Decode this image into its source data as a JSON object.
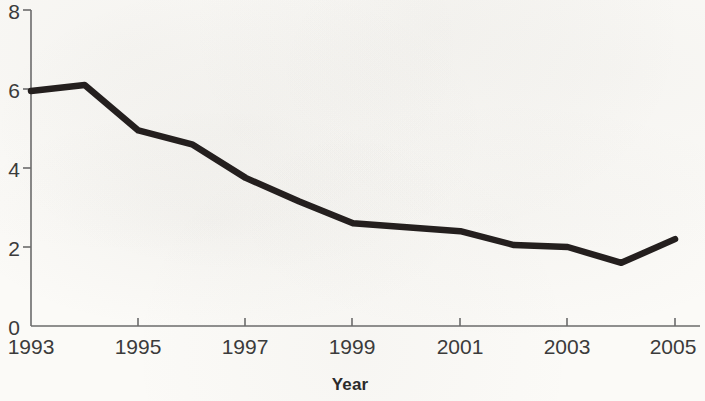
{
  "figure": {
    "background_color": "#fbfaf7",
    "line_color": "#241f1e",
    "axis_color": "#6b6b6b",
    "text_color": "#3b3b3b"
  },
  "chart_data": {
    "type": "line",
    "title": "",
    "subtitle": "",
    "xlabel": "Year",
    "ylabel": "",
    "x": [
      1993,
      1994,
      1995,
      1996,
      1997,
      1998,
      1999,
      2000,
      2001,
      2002,
      2003,
      2004,
      2005
    ],
    "values": [
      5.95,
      6.1,
      4.95,
      4.6,
      3.75,
      3.15,
      2.6,
      2.5,
      2.4,
      2.05,
      2.0,
      1.6,
      2.2
    ],
    "series": [
      {
        "name": "rate",
        "values": [
          5.95,
          6.1,
          4.95,
          4.6,
          3.75,
          3.15,
          2.6,
          2.5,
          2.4,
          2.05,
          2.0,
          1.6,
          2.2
        ]
      }
    ],
    "xlim": [
      1993,
      2005
    ],
    "ylim": [
      0,
      8
    ],
    "y_ticks": [
      0,
      2,
      4,
      6,
      8
    ],
    "x_ticks": [
      1993,
      1995,
      1997,
      1999,
      2001,
      2003,
      2005
    ],
    "grid": false,
    "legend": null,
    "legend_position": "none",
    "annotations": []
  },
  "axes": {
    "y_tick_labels": [
      "8",
      "6",
      "4",
      "2",
      "0"
    ],
    "x_tick_labels": [
      "1993",
      "1995",
      "1997",
      "1999",
      "2001",
      "2003",
      "2005"
    ],
    "x_axis_title": "Year"
  }
}
